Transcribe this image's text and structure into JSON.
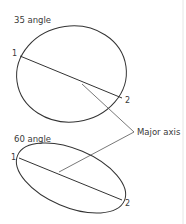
{
  "diagram": {
    "top": {
      "title": "35 angle",
      "point_start": "1",
      "point_end": "2"
    },
    "bottom": {
      "title": "60 angle",
      "point_start": "1",
      "point_end": "2"
    },
    "callout": "Major axis",
    "colors": {
      "stroke": "#333333",
      "text": "#3a3a3a",
      "edge": "#e4e4e4"
    }
  }
}
